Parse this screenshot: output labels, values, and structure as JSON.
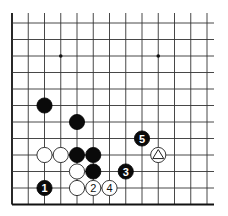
{
  "diagram": {
    "type": "go-board-fragment",
    "columns": 13,
    "rows": 12,
    "edges": [
      "left",
      "bottom"
    ],
    "star_points": [
      {
        "col": 3,
        "row": 2
      },
      {
        "col": 9,
        "row": 2
      }
    ],
    "stones": [
      {
        "color": "black",
        "col": 2,
        "row": 5,
        "label": ""
      },
      {
        "color": "black",
        "col": 4,
        "row": 6,
        "label": ""
      },
      {
        "color": "white",
        "col": 2,
        "row": 8,
        "label": ""
      },
      {
        "color": "white",
        "col": 3,
        "row": 8,
        "label": ""
      },
      {
        "color": "black",
        "col": 4,
        "row": 8,
        "label": ""
      },
      {
        "color": "black",
        "col": 5,
        "row": 8,
        "label": ""
      },
      {
        "color": "white",
        "col": 4,
        "row": 9,
        "label": ""
      },
      {
        "color": "black",
        "col": 5,
        "row": 9,
        "label": ""
      },
      {
        "color": "white",
        "col": 4,
        "row": 10,
        "label": ""
      },
      {
        "color": "black",
        "col": 2,
        "row": 10,
        "label": "1"
      },
      {
        "color": "white",
        "col": 5,
        "row": 10,
        "label": "2"
      },
      {
        "color": "black",
        "col": 7,
        "row": 9,
        "label": "3"
      },
      {
        "color": "white",
        "col": 6,
        "row": 10,
        "label": "4"
      },
      {
        "color": "black",
        "col": 8,
        "row": 7,
        "label": "5"
      },
      {
        "color": "white",
        "col": 9,
        "row": 8,
        "label": "",
        "mark": "triangle"
      }
    ]
  }
}
